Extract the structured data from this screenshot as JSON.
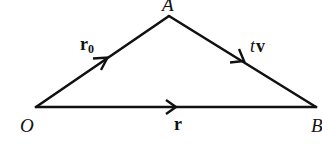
{
  "diagram": {
    "type": "vector-triangle",
    "points": {
      "O": {
        "label": "O",
        "x": 36,
        "y": 107
      },
      "A": {
        "label": "A",
        "x": 169,
        "y": 16
      },
      "B": {
        "label": "B",
        "x": 316,
        "y": 107
      }
    },
    "edges": [
      {
        "from": "O",
        "to": "A",
        "label_main": "r",
        "label_sub": "0",
        "direction": "O→A"
      },
      {
        "from": "A",
        "to": "B",
        "label_prefix": "t",
        "label_main": "v",
        "direction": "A→B"
      },
      {
        "from": "O",
        "to": "B",
        "label_main": "r",
        "direction": "O→B"
      }
    ],
    "colors": {
      "stroke": "#111111",
      "background": "#ffffff"
    }
  },
  "labels": {
    "O": "O",
    "A": "A",
    "B": "B",
    "r0_main": "r",
    "r0_sub": "0",
    "tv_t": "t",
    "tv_v": "v",
    "r": "r"
  }
}
